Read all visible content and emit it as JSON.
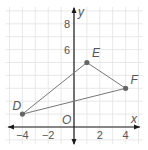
{
  "diagram": {
    "type": "coordinate-plane-triangle",
    "axes": {
      "x_label": "x",
      "y_label": "y",
      "origin_label": "O",
      "x_ticks": [
        {
          "value": -4,
          "label": "−4"
        },
        {
          "value": -2,
          "label": "−2"
        },
        {
          "value": 2,
          "label": "2"
        },
        {
          "value": 4,
          "label": "4"
        }
      ],
      "y_ticks": [
        {
          "value": 6,
          "label": "6"
        },
        {
          "value": 8,
          "label": "8"
        }
      ],
      "x_range": [
        -5,
        5
      ],
      "y_range": [
        -1,
        9
      ],
      "grid": true
    },
    "points": [
      {
        "name": "D",
        "x": -4,
        "y": 1
      },
      {
        "name": "E",
        "x": 1,
        "y": 5
      },
      {
        "name": "F",
        "x": 4,
        "y": 3
      }
    ],
    "segments": [
      [
        "D",
        "E"
      ],
      [
        "E",
        "F"
      ],
      [
        "F",
        "D"
      ]
    ],
    "colors": {
      "grid": "#e2e2e2",
      "axis": "#1a1a1a",
      "segment": "#777777",
      "point": "#666666",
      "label": "#555555"
    }
  }
}
